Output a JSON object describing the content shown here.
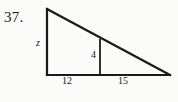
{
  "figure": {
    "problem_number": "37.",
    "type": "right-triangle-with-inscribed-altitude",
    "stroke_color": "#1a1a1a",
    "background_color": "#fbfbfa",
    "labels": {
      "left_side": "z",
      "inner_height": "4",
      "base_left_segment": "12",
      "base_right_segment": "15"
    },
    "geometry": {
      "apex": [
        47,
        9
      ],
      "bottom_left": [
        47,
        75
      ],
      "bottom_right": [
        170,
        75
      ],
      "inner_vertical_x": 100,
      "inner_vertical_top": [
        100,
        40
      ],
      "inner_vertical_bottom": [
        100,
        75
      ]
    }
  }
}
